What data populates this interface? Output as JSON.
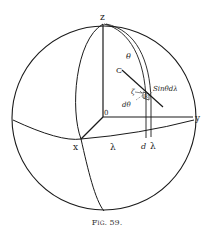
{
  "figure": {
    "caption": "Fig. 59.",
    "labels": {
      "z": "z",
      "y": "y",
      "x": "x",
      "origin": "0",
      "theta": "θ",
      "c": "C",
      "zeta": "ζ",
      "r": "R",
      "sin_theta_dlambda": "Sinθdλ",
      "d_theta": "dθ",
      "lambda": "λ",
      "d": "d",
      "lambda2": "λ"
    },
    "colors": {
      "line": "#1a1a1a",
      "background": "#ffffff"
    }
  }
}
